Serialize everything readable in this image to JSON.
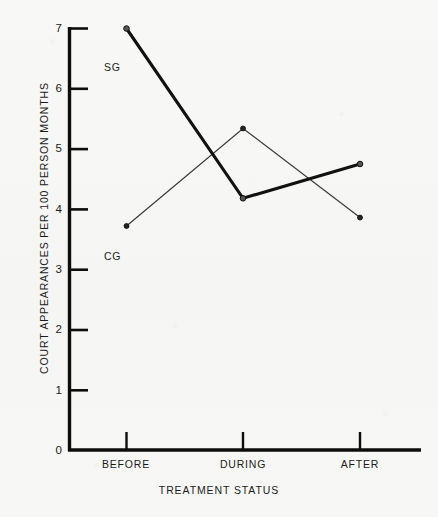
{
  "chart_data": {
    "type": "line",
    "title": "",
    "xlabel": "TREATMENT STATUS",
    "ylabel": "COURT APPEARANCES PER 100 PERSON MONTHS",
    "categories": [
      "BEFORE",
      "DURING",
      "AFTER"
    ],
    "xtick_labels": [
      "BEFORE",
      "DURING",
      "AFTER"
    ],
    "ytick_labels": [
      "0",
      "1",
      "2",
      "3",
      "4",
      "5",
      "6",
      "7"
    ],
    "ylim": [
      0,
      7
    ],
    "ytick_values": [
      0,
      1,
      2,
      3,
      4,
      5,
      6,
      7
    ],
    "grid": false,
    "legend_position": "inline-annotations",
    "series": [
      {
        "name": "SG",
        "label": "SG",
        "style": "thick-solid",
        "color": "#111111",
        "marker": "circle",
        "values": [
          7.0,
          4.18,
          4.75
        ]
      },
      {
        "name": "CG",
        "label": "CG",
        "style": "thin-solid",
        "color": "#3a3a3a",
        "marker": "circle",
        "values": [
          3.72,
          5.34,
          3.86
        ]
      }
    ],
    "annotations": [
      {
        "text": "SG",
        "series": "SG",
        "x_category": "BEFORE",
        "y": 6.45
      },
      {
        "text": "CG",
        "series": "CG",
        "x_category": "BEFORE",
        "y": 3.05
      }
    ]
  },
  "axis": {
    "y_title": "COURT APPEARANCES PER 100 PERSON MONTHS",
    "x_title": "TREATMENT STATUS"
  },
  "colors": {
    "background": "#f7f7f5",
    "axis": "#0d0d0d",
    "sg_line": "#111111",
    "cg_line": "#3a3a3a",
    "text": "#1b1b1b"
  }
}
